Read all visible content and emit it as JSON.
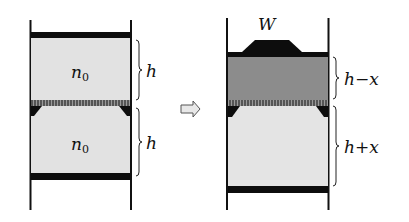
{
  "diagram": {
    "type": "piston-cylinder before/after",
    "left": {
      "top_gas_label": "n",
      "top_gas_sub": "0",
      "bottom_gas_label": "n",
      "bottom_gas_sub": "0",
      "top_height_label": "h",
      "bottom_height_label": "h"
    },
    "arrow": "⇨",
    "right": {
      "weight_label": "W",
      "top_height_label": "h−x",
      "bottom_height_label": "h+x"
    },
    "colors": {
      "wall": "#111111",
      "piston": "#0d0d0d",
      "gas_light": "#e2e2e2",
      "gas_dark": "#8c8c8c",
      "membrane": "#6a6a6a",
      "background": "#ffffff"
    }
  }
}
